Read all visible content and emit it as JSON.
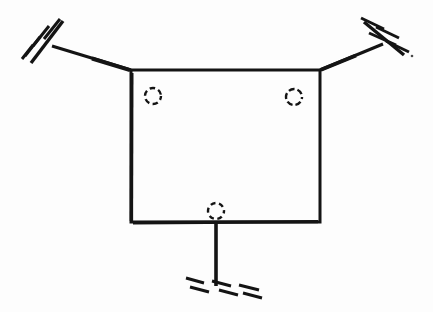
{
  "drawing": {
    "title": "Structural support sketch",
    "medium": "scanned hand drawing",
    "ink_color": "#141414",
    "background_color": "#fdfdfd",
    "width": 433,
    "height": 312
  },
  "body": {
    "label": "rectangular-plate",
    "shape": "rectangle",
    "x": 131,
    "y": 70,
    "width": 189,
    "height": 152
  },
  "holes": [
    {
      "label": "hole-top-left",
      "cx": 153,
      "cy": 96,
      "r": 8
    },
    {
      "label": "hole-top-right",
      "cx": 294,
      "cy": 97,
      "r": 8
    },
    {
      "label": "hole-bottom-center",
      "cx": 216,
      "cy": 211,
      "r": 8
    }
  ],
  "members": [
    {
      "label": "diagonal-member-left",
      "from_x": 52,
      "from_y": 46,
      "to_x": 131,
      "to_y": 70
    },
    {
      "label": "diagonal-member-right",
      "from_x": 320,
      "from_y": 70,
      "to_x": 383,
      "to_y": 44
    },
    {
      "label": "vertical-member-bottom",
      "from_x": 216,
      "from_y": 222,
      "to_x": 216,
      "to_y": 286
    }
  ],
  "supports": [
    {
      "label": "support-upper-left",
      "bar_x1": 31,
      "bar_y1": 63,
      "bar_x2": 63,
      "bar_y2": 21,
      "hatch_count": 3
    },
    {
      "label": "support-upper-right",
      "bar_x1": 364,
      "bar_y1": 22,
      "bar_x2": 404,
      "bar_y2": 55,
      "hatch_count": 3
    },
    {
      "label": "support-bottom",
      "bar_x1": 186,
      "bar_y1": 281,
      "bar_x2": 256,
      "bar_y2": 289,
      "hatch_count": 3
    }
  ],
  "specks": [
    {
      "label": "speck-right",
      "cx": 412,
      "cy": 56,
      "r": 1.3
    }
  ]
}
